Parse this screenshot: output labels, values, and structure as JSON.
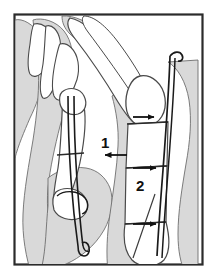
{
  "figure": {
    "frame": {
      "border_color": "#2b2b2b",
      "background_color": "#ffffff",
      "x": 14,
      "y": 14,
      "width": 189,
      "height": 251
    },
    "colors": {
      "soft_tissue_fill": "#d9d9d9",
      "bone_fill": "#ffffff",
      "outline": "#3a3a3a",
      "wire": "#1a1a1a",
      "arrow": "#111111",
      "label": "#111111"
    },
    "labels": [
      {
        "id": "label-1",
        "text": "1",
        "x": 104,
        "y": 143
      },
      {
        "id": "label-2",
        "text": "2",
        "x": 139,
        "y": 186
      }
    ],
    "arrows": [
      {
        "id": "arrow-finger1-fracture",
        "points_to": "finger-1-fracture-line",
        "x1": 127,
        "y1": 155,
        "x2": 104,
        "y2": 155
      },
      {
        "id": "arrow-finger2-head",
        "points_to": "finger-2-proximal-fracture",
        "x1": 133,
        "y1": 117,
        "x2": 155,
        "y2": 117
      },
      {
        "id": "arrow-finger2-mid",
        "points_to": "finger-2-middle-fracture",
        "x1": 133,
        "y1": 168,
        "x2": 157,
        "y2": 168
      },
      {
        "id": "arrow-finger2-distal",
        "points_to": "finger-2-distal-fracture",
        "x1": 133,
        "y1": 224,
        "x2": 157,
        "y2": 224
      }
    ],
    "wires": [
      {
        "id": "wire-finger-1",
        "bend": "distal-hook"
      },
      {
        "id": "wire-finger-2",
        "bend": "proximal-hook"
      }
    ]
  }
}
